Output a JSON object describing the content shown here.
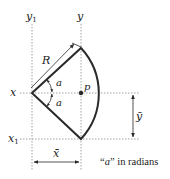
{
  "diagram": {
    "labels": {
      "y1": "y",
      "y1_sub": "1",
      "y": "y",
      "x": "x",
      "x1": "x",
      "x1_sub": "1",
      "R": "R",
      "p": "p",
      "a_upper": "a",
      "a_lower": "a",
      "xbar": "x̄",
      "ybar": "ȳ"
    },
    "note": {
      "open_quote": "“",
      "symbol": "a",
      "close_quote": "”",
      "rest": " in radians"
    },
    "colors": {
      "stroke": "#2a2a2a",
      "dotted": "#8a8a8a",
      "background": "#ffffff"
    }
  }
}
